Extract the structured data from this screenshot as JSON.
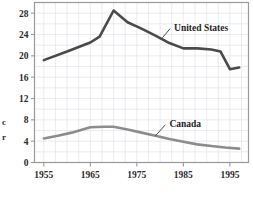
{
  "chart_data": {
    "type": "line",
    "title": "",
    "xlabel": "",
    "ylabel": "c r",
    "ylabel_fragments": [
      "c",
      "r"
    ],
    "xlim": [
      1953,
      1999
    ],
    "ylim": [
      0,
      30
    ],
    "ytick_values": [
      0,
      4,
      8,
      12,
      16,
      20,
      24,
      28
    ],
    "ytick_labels": [
      "0",
      "4",
      "8",
      "12",
      "16",
      "20",
      "24",
      "28"
    ],
    "xtick_values": [
      1955,
      1965,
      1975,
      1985,
      1995
    ],
    "xtick_labels": [
      "1955",
      "1965",
      "1975",
      "1985",
      "1995"
    ],
    "grid": true,
    "legend_position": "inline-annotation",
    "series": [
      {
        "name": "United States",
        "color": "#4a4a4a",
        "label_x": 1983,
        "label_y": 24.9,
        "leader_from_x": 1980.5,
        "leader_from_y": 23.4,
        "x": [
          1955,
          1960,
          1965,
          1967,
          1970,
          1973,
          1976,
          1979,
          1982,
          1985,
          1988,
          1991,
          1993,
          1995,
          1997
        ],
        "values": [
          19.2,
          20.8,
          22.5,
          23.6,
          28.5,
          26.3,
          25.1,
          23.8,
          22.4,
          21.4,
          21.4,
          21.2,
          20.8,
          17.5,
          17.8
        ]
      },
      {
        "name": "Canada",
        "color": "#8c8c8c",
        "label_x": 1982,
        "label_y": 6.9,
        "leader_from_x": 1979,
        "leader_from_y": 5.0,
        "x": [
          1955,
          1958,
          1961,
          1965,
          1968,
          1970,
          1973,
          1976,
          1979,
          1982,
          1985,
          1988,
          1991,
          1994,
          1997
        ],
        "values": [
          4.5,
          5.0,
          5.6,
          6.6,
          6.7,
          6.7,
          6.2,
          5.6,
          5.0,
          4.4,
          3.9,
          3.4,
          3.1,
          2.8,
          2.6
        ]
      }
    ],
    "colors": {
      "frame": "#9a9a9a",
      "grid": "#e2e2ea",
      "text": "#2b2b2b",
      "background": "#ffffff",
      "us_line": "#4a4a4a",
      "canada_line": "#8c8c8c"
    }
  }
}
